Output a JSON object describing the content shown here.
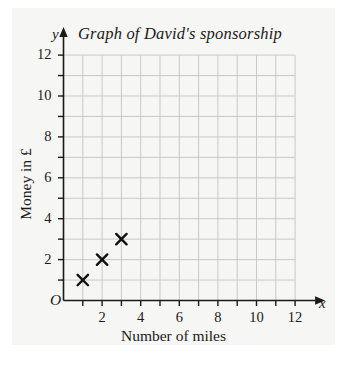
{
  "chart_data": {
    "type": "scatter",
    "title": "Graph of David's sponsorship",
    "xlabel": "Number of miles",
    "ylabel": "Money in £",
    "x_axis_letter": "x",
    "y_axis_letter": "y",
    "origin_label": "O",
    "xlim": [
      0,
      12
    ],
    "ylim": [
      0,
      12
    ],
    "xticks": [
      2,
      4,
      6,
      8,
      10,
      12
    ],
    "yticks": [
      2,
      4,
      6,
      8,
      10,
      12
    ],
    "xtick_labels": [
      "2",
      "4",
      "6",
      "8",
      "10",
      "12"
    ],
    "ytick_labels": [
      "2",
      "4",
      "6",
      "8",
      "10",
      "12"
    ],
    "minor_tick_step": 1,
    "grid": true,
    "grid_step": 1,
    "legend": null,
    "marker": "x-cross",
    "points": [
      {
        "x": 1,
        "y": 1
      },
      {
        "x": 2,
        "y": 2
      },
      {
        "x": 3,
        "y": 3
      }
    ],
    "series": [
      {
        "name": "sponsorship",
        "x": [
          1,
          2,
          3
        ],
        "y": [
          1,
          2,
          3
        ]
      }
    ]
  },
  "colors": {
    "page_background": "#ffffff",
    "paper_background": "#f6f6f4",
    "grid_line": "#c9c9c9",
    "axis_line": "#1a1a1a",
    "text": "#1a1a1a",
    "marker": "#111111"
  }
}
